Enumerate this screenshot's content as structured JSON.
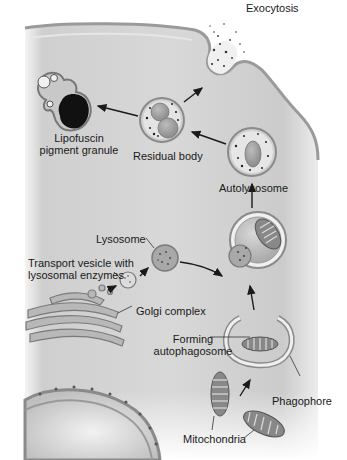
{
  "diagram": {
    "type": "biology-process-diagram",
    "colors": {
      "cytoplasm": "#d6d6d6",
      "membrane": "#a8a8a8",
      "organelle_fill": "#bdbdbd",
      "lysosome_fill": "#999999",
      "dark_pigment": "#111111",
      "text": "#1a1a1a"
    },
    "labels": {
      "exocytosis": "Exocytosis",
      "lipofuscin_line1": "Lipofuscin",
      "lipofuscin_line2": "pigment granule",
      "residual_body": "Residual body",
      "autolysosome": "Autolysosome",
      "lysosome": "Lysosome",
      "transport_line1": "Transport vesicle with",
      "transport_line2": "lysosomal enzymes",
      "golgi": "Golgi complex",
      "forming_line1": "Forming",
      "forming_line2": "autophagosome",
      "phagophore": "Phagophore",
      "mitochondria": "Mitochondria"
    },
    "nodes": [
      {
        "id": "mitochondria",
        "label": "Mitochondria"
      },
      {
        "id": "phagophore",
        "label": "Phagophore"
      },
      {
        "id": "forming_autophagosome",
        "label": "Forming autophagosome"
      },
      {
        "id": "golgi",
        "label": "Golgi complex"
      },
      {
        "id": "transport_vesicle",
        "label": "Transport vesicle with lysosomal enzymes"
      },
      {
        "id": "lysosome",
        "label": "Lysosome"
      },
      {
        "id": "fusion",
        "label": ""
      },
      {
        "id": "autolysosome",
        "label": "Autolysosome"
      },
      {
        "id": "residual_body",
        "label": "Residual body"
      },
      {
        "id": "exocytosis",
        "label": "Exocytosis"
      },
      {
        "id": "lipofuscin",
        "label": "Lipofuscin pigment granule"
      }
    ],
    "edges": [
      {
        "from": "mitochondria",
        "to": "forming_autophagosome"
      },
      {
        "from": "forming_autophagosome",
        "to": "fusion"
      },
      {
        "from": "golgi",
        "to": "transport_vesicle"
      },
      {
        "from": "transport_vesicle",
        "to": "lysosome"
      },
      {
        "from": "lysosome",
        "to": "fusion"
      },
      {
        "from": "fusion",
        "to": "autolysosome"
      },
      {
        "from": "autolysosome",
        "to": "residual_body"
      },
      {
        "from": "residual_body",
        "to": "exocytosis"
      },
      {
        "from": "residual_body",
        "to": "lipofuscin"
      }
    ]
  }
}
